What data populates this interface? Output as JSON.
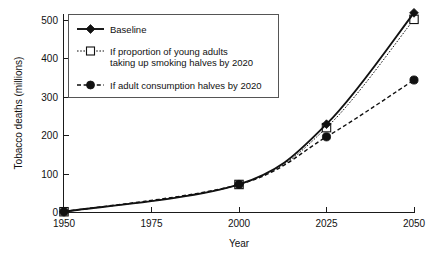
{
  "chart_data": {
    "type": "line",
    "title": "",
    "subtitle": "",
    "xlabel": "Year",
    "ylabel": "Tobacco deaths (millions)",
    "xlim": [
      1950,
      2050
    ],
    "ylim": [
      0,
      500
    ],
    "x": [
      1950,
      2000,
      2025,
      2050
    ],
    "xticks": [
      "1950",
      "1975",
      "2000",
      "2025",
      "2050"
    ],
    "xtick_values": [
      1950,
      1975,
      2000,
      2025,
      2050
    ],
    "yticks": [
      "0",
      "100",
      "200",
      "300",
      "400",
      "500"
    ],
    "ytick_values": [
      0,
      100,
      200,
      300,
      400,
      500
    ],
    "grid": false,
    "legend_position": "upper left",
    "series": [
      {
        "name": "Baseline",
        "marker": "filled-diamond",
        "line_style": "solid",
        "values": [
          2,
          73,
          230,
          520
        ]
      },
      {
        "name": "If proportion of young adults taking up smoking halves by 2020",
        "marker": "open-square",
        "line_style": "dotted",
        "values": [
          2,
          73,
          221,
          503
        ]
      },
      {
        "name": "If adult consumption halves by 2020",
        "marker": "filled-circle",
        "line_style": "dashed",
        "values": [
          2,
          73,
          197,
          345
        ]
      }
    ]
  },
  "legend": {
    "entries": [
      {
        "label": "Baseline",
        "label_line2": ""
      },
      {
        "label": "If proportion of young adults",
        "label_line2": "taking up smoking halves by 2020"
      },
      {
        "label": "If adult consumption halves by 2020",
        "label_line2": ""
      }
    ]
  },
  "colors": {
    "ink": "#111111",
    "axis": "#1a1a1a",
    "legend_border": "#555555",
    "background": "#ffffff"
  }
}
